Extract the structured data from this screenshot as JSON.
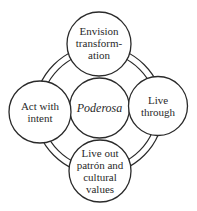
{
  "diagram": {
    "center": {
      "label": "Poderosa"
    },
    "nodes": [
      {
        "id": "top",
        "lines": [
          "Envision",
          "transform-",
          "ation"
        ]
      },
      {
        "id": "left",
        "lines": [
          "Act with",
          "intent"
        ]
      },
      {
        "id": "right",
        "lines": [
          "Live",
          "through"
        ]
      },
      {
        "id": "bottom",
        "lines": [
          "Live out",
          "patrón and",
          "cultural",
          "values"
        ]
      }
    ],
    "colors": {
      "stroke": "#2a2a2a",
      "fill": "#ffffff"
    }
  }
}
